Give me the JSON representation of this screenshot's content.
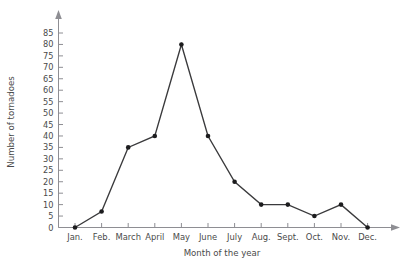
{
  "chart_data": {
    "type": "line",
    "title": "",
    "xlabel": "Month of the year",
    "ylabel": "Number of tornadoes",
    "categories": [
      "Jan.",
      "Feb.",
      "March",
      "April",
      "May",
      "June",
      "July",
      "Aug.",
      "Sept.",
      "Oct.",
      "Nov.",
      "Dec."
    ],
    "values": [
      0,
      7,
      35,
      40,
      80,
      40,
      20,
      10,
      10,
      5,
      10,
      0
    ],
    "ylim": [
      0,
      85
    ],
    "yticks": [
      0,
      5,
      10,
      15,
      20,
      25,
      30,
      35,
      40,
      45,
      50,
      55,
      60,
      65,
      70,
      75,
      80,
      85
    ],
    "ytick_labels": [
      "0",
      "5",
      "10",
      "15",
      "20",
      "25",
      "30",
      "35",
      "40",
      "45",
      "50",
      "55",
      "60",
      "65",
      "70",
      "75",
      "80",
      "85"
    ],
    "grid": false,
    "legend": false,
    "series_color": "#3a3a3c",
    "marker": "circle",
    "marker_color": "#1c1c1e",
    "axis_color": "#8e8e93",
    "background_color": "#ffffff",
    "y_axis_arrow": true,
    "x_axis_arrow": true
  }
}
